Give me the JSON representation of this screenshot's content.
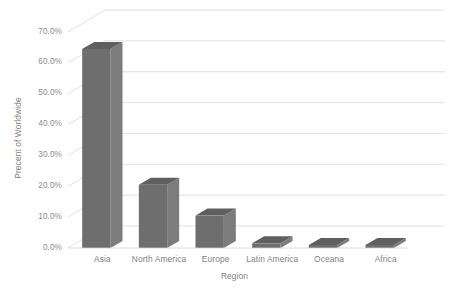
{
  "chart_data": {
    "type": "bar",
    "title": "",
    "subtitle": "",
    "xlabel": "Region",
    "ylabel": "Precent of Worldwide",
    "categories": [
      "Asia",
      "North America",
      "Europe",
      "Latin America",
      "Oceana",
      "Africa"
    ],
    "values": [
      64.5,
      20.5,
      10.5,
      1.5,
      1.0,
      1.0
    ],
    "series": [
      {
        "name": "Percent of Worldwide",
        "values": [
          64.5,
          20.5,
          10.5,
          1.5,
          1.0,
          1.0
        ]
      }
    ],
    "ylim": [
      0,
      70
    ],
    "ytick_values": [
      0,
      10,
      20,
      30,
      40,
      50,
      60,
      70
    ],
    "ytick_labels": [
      "0.0%",
      "10.0%",
      "20.0%",
      "30.0%",
      "40.0%",
      "50.0%",
      "60.0%",
      "70.0%"
    ],
    "grid": true,
    "grid_axis": "y",
    "legend": false,
    "legend_position": "none",
    "three_d": true,
    "annotations": []
  },
  "style": {
    "background": "#ffffff",
    "bar_front": "#6e6e6e",
    "bar_top": "#5f5f5f",
    "bar_side": "#7c7c7c",
    "gridline": "#d9d9d9",
    "axis_line": "#d0d0d0",
    "text": "#7f7f7f",
    "tick_text": "#8b8b8b"
  }
}
